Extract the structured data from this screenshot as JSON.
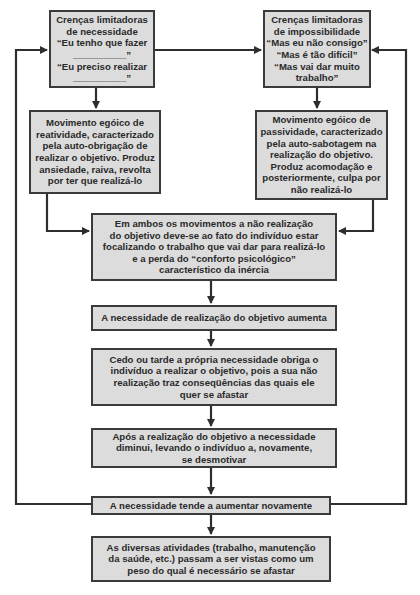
{
  "diagram": {
    "type": "flowchart",
    "colors": {
      "box_fill": "#dcdcdc",
      "border": "#3a3a3a",
      "text": "#2a2a2a",
      "background": "#ffffff"
    },
    "nodes": [
      {
        "id": "crencas-necessidade",
        "lines": [
          "Crenças limitadoras",
          "de necessidade",
          "“Eu tenho que fazer",
          "__________”",
          "“Eu preciso realizar",
          "__________”"
        ]
      },
      {
        "id": "crencas-impossibilidade",
        "lines": [
          "Crenças limitadoras",
          "de impossibilidade",
          "“Mas eu não consigo”",
          "“Mas é tão difícil”",
          "“Mas vai dar muito",
          "trabalho”"
        ]
      },
      {
        "id": "movimento-reatividade",
        "lines": [
          "Movimento egóico de",
          "reatividade, caracterizado",
          "pela auto-obrigação de",
          "realizar o objetivo. Produz",
          "ansiedade, raiva, revolta",
          "por ter que realizá-lo"
        ]
      },
      {
        "id": "movimento-passividade",
        "lines": [
          "Movimento egóico de",
          "passividade, caracterizado",
          "pela auto-sabotagem na",
          "realização do objetivo.",
          "Produz acomodação e",
          "posteriormente, culpa por",
          "não realizá-lo"
        ]
      },
      {
        "id": "ambos-movimentos",
        "lines": [
          "Em ambos os movimentos a não realização",
          "do objetivo deve-se ao fato do indivíduo estar",
          "focalizando o trabalho que vai dar para realizá-lo",
          "e a perda do “conforto psicológico”",
          "característico da inércia"
        ]
      },
      {
        "id": "necessidade-aumenta",
        "lines": [
          "A necessidade de realização do objetivo aumenta"
        ]
      },
      {
        "id": "cedo-ou-tarde",
        "lines": [
          "Cedo ou tarde a própria necessidade obriga o",
          "indivíduo a realizar o objetivo, pois a sua não",
          "realização traz conseqüências das quais ele",
          "quer se afastar"
        ]
      },
      {
        "id": "apos-realizacao",
        "lines": [
          "Após a realização do objetivo a necessidade",
          "diminui, levando o indivíduo a, novamente,",
          "se desmotivar"
        ]
      },
      {
        "id": "tende-aumentar",
        "lines": [
          "A necessidade tende a aumentar novamente"
        ]
      },
      {
        "id": "diversas-atividades",
        "lines": [
          "As diversas atividades (trabalho, manutenção",
          "da saúde, etc.) passam a ser vistas como um",
          "peso do qual é necessário se afastar"
        ]
      }
    ],
    "edges": [
      {
        "from": "crencas-necessidade",
        "to": "crencas-impossibilidade"
      },
      {
        "from": "crencas-necessidade",
        "to": "movimento-reatividade"
      },
      {
        "from": "crencas-impossibilidade",
        "to": "movimento-passividade"
      },
      {
        "from": "movimento-reatividade",
        "to": "ambos-movimentos"
      },
      {
        "from": "movimento-passividade",
        "to": "ambos-movimentos"
      },
      {
        "from": "ambos-movimentos",
        "to": "necessidade-aumenta"
      },
      {
        "from": "necessidade-aumenta",
        "to": "cedo-ou-tarde"
      },
      {
        "from": "cedo-ou-tarde",
        "to": "apos-realizacao"
      },
      {
        "from": "apos-realizacao",
        "to": "tende-aumentar"
      },
      {
        "from": "tende-aumentar",
        "to": "diversas-atividades"
      },
      {
        "from": "tende-aumentar",
        "to": "crencas-necessidade",
        "route": "left-loop"
      },
      {
        "from": "tende-aumentar",
        "to": "crencas-impossibilidade",
        "route": "right-loop"
      }
    ]
  }
}
